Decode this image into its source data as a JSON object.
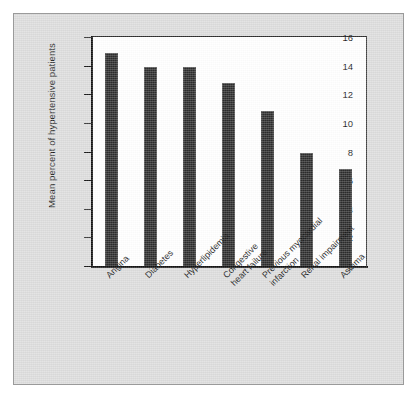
{
  "figure": {
    "background_color": "#dcdcdc",
    "plot_background_color": "#ffffff",
    "bar_color": "#2b2b2b",
    "axis_color": "#111111"
  },
  "chart_data": {
    "type": "bar",
    "title": "",
    "subtitle": "",
    "xlabel": "",
    "ylabel": "Mean percent of hypertensive patients",
    "categories": [
      "Angina",
      "Diabetes",
      "Hyperlipidemia",
      "Congestive\nheart failure",
      "Previous myocardial\ninfarction",
      "Renal impairment",
      "Asthma"
    ],
    "values": [
      14.9,
      13.9,
      13.9,
      12.8,
      10.8,
      7.9,
      6.8
    ],
    "ylim": [
      0,
      16
    ],
    "ytick_values": [
      0,
      2,
      4,
      6,
      8,
      10,
      12,
      14,
      16
    ],
    "ytick_labels": [
      "0",
      "2",
      "4",
      "6",
      "8",
      "10",
      "12",
      "14",
      "16"
    ],
    "grid": false,
    "legend": false,
    "legend_position": "none",
    "xtick_label_rotation": -45
  }
}
